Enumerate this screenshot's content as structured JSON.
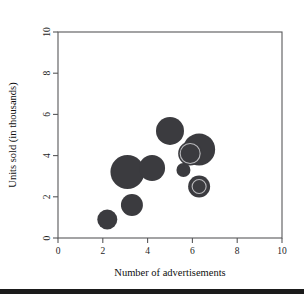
{
  "chart_data": {
    "type": "scatter",
    "title": "",
    "xlabel": "Number of advertisements",
    "ylabel": "Units sold (in thousands)",
    "xlim": [
      0,
      10
    ],
    "ylim": [
      0,
      10
    ],
    "xticks": [
      0,
      2,
      4,
      6,
      8,
      10
    ],
    "yticks": [
      0,
      2,
      4,
      6,
      8,
      10
    ],
    "xtick_labels": [
      "0",
      "2",
      "4",
      "6",
      "8",
      "10"
    ],
    "ytick_labels": [
      "0",
      "2",
      "4",
      "6",
      "8",
      "10"
    ],
    "grid": false,
    "legend": "none",
    "marker_color": "#3b3b3f",
    "ring_color": "#b9b9bc",
    "points": [
      {
        "x": 2.2,
        "y": 0.9,
        "r": 10,
        "ring": false,
        "ring_r": 0
      },
      {
        "x": 3.1,
        "y": 3.2,
        "r": 17,
        "ring": false,
        "ring_r": 0
      },
      {
        "x": 3.3,
        "y": 1.6,
        "r": 11,
        "ring": false,
        "ring_r": 0
      },
      {
        "x": 4.2,
        "y": 3.4,
        "r": 13,
        "ring": false,
        "ring_r": 0
      },
      {
        "x": 5.0,
        "y": 5.2,
        "r": 14,
        "ring": false,
        "ring_r": 0
      },
      {
        "x": 5.6,
        "y": 3.3,
        "r": 7,
        "ring": false,
        "ring_r": 0
      },
      {
        "x": 6.3,
        "y": 4.3,
        "r": 16,
        "ring": false,
        "ring_r": 0
      },
      {
        "x": 5.9,
        "y": 4.1,
        "r": 12,
        "ring": true,
        "ring_r": 10
      },
      {
        "x": 6.3,
        "y": 2.5,
        "r": 11,
        "ring": true,
        "ring_r": 7
      }
    ]
  },
  "figure": {
    "width": 304,
    "height": 294,
    "plot_left": 58,
    "plot_right": 282,
    "plot_top": 32,
    "plot_bottom": 238,
    "background": "#ffffff",
    "frame_color": "#58585a",
    "footer_bar_color": "#1b1b1b"
  }
}
